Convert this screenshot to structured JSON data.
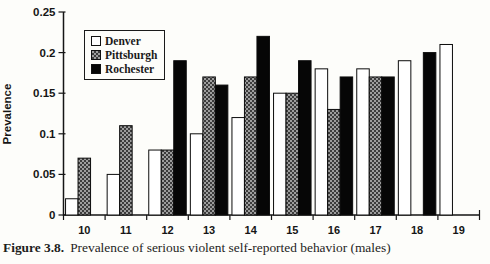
{
  "figure": {
    "caption_label": "Figure 3.8.",
    "caption_text": "Prevalence of serious violent self-reported behavior (males)"
  },
  "chart_data": {
    "type": "bar",
    "title": "",
    "xlabel": "",
    "ylabel": "Prevalence",
    "categories": [
      "10",
      "11",
      "12",
      "13",
      "14",
      "15",
      "16",
      "17",
      "18",
      "19"
    ],
    "series": [
      {
        "name": "Denver",
        "fill": "#ffffff",
        "values": [
          0.02,
          0.05,
          0.08,
          0.1,
          0.12,
          0.15,
          0.18,
          0.18,
          0.19,
          0.21
        ]
      },
      {
        "name": "Pittsburgh",
        "fill": "checker",
        "base_color": "#9d9d9d",
        "dot_color": "#3c3c3c",
        "values": [
          0.07,
          0.11,
          0.08,
          0.17,
          0.17,
          0.15,
          0.13,
          0.17,
          null,
          null
        ]
      },
      {
        "name": "Rochester",
        "fill": "#060606",
        "values": [
          null,
          null,
          0.19,
          0.16,
          0.22,
          0.19,
          0.17,
          0.17,
          0.2,
          null
        ]
      }
    ],
    "ylim": [
      0,
      0.25
    ],
    "yticks": [
      0,
      0.05,
      0.1,
      0.15,
      0.2,
      0.25
    ],
    "ytick_labels": [
      "0",
      "0.05",
      "0.1",
      "0.15",
      "0.2",
      "0.25"
    ],
    "grid": false,
    "legend_position": "top-left",
    "axis_color": "#151515",
    "text_color": "#151515"
  }
}
